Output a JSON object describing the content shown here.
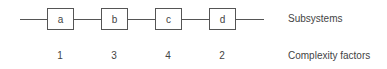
{
  "diagram": {
    "subsystems": [
      {
        "label": "a",
        "complexity": "1"
      },
      {
        "label": "b",
        "complexity": "3"
      },
      {
        "label": "c",
        "complexity": "4"
      },
      {
        "label": "d",
        "complexity": "2"
      }
    ],
    "row_labels": {
      "subsystems": "Subsystems",
      "complexity": "Complexity factors"
    }
  }
}
